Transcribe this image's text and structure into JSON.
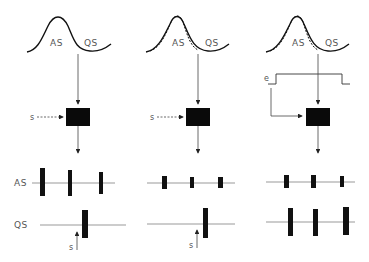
{
  "panels": [
    {
      "id": "panel-1",
      "curve_labels": {
        "as": "AS",
        "qs": "QS"
      },
      "dashed_curve": false,
      "stimulus_label": "s",
      "stimulus_arrow": "dashed",
      "trace_labels": {
        "as": "AS",
        "qs": "QS"
      },
      "qs_stimulus_label": "s"
    },
    {
      "id": "panel-2",
      "curve_labels": {
        "as": "AS",
        "qs": "QS"
      },
      "dashed_curve": true,
      "stimulus_label": "s",
      "stimulus_arrow": "dashed",
      "qs_stimulus_label": "s"
    },
    {
      "id": "panel-3",
      "curve_labels": {
        "as": "AS",
        "qs": "QS"
      },
      "dashed_curve": true,
      "external_label": "e",
      "external_arrow": "solid"
    }
  ],
  "colors": {
    "ink": "#111111",
    "label": "#555555",
    "line": "#444444"
  }
}
